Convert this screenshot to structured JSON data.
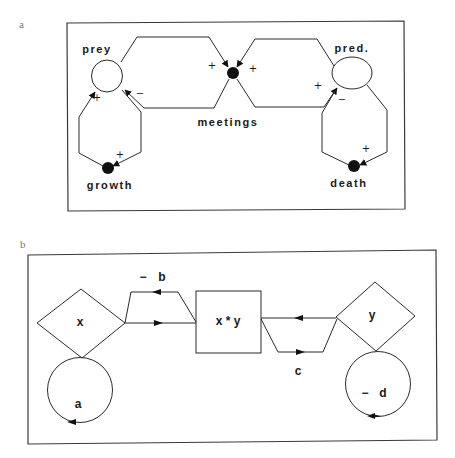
{
  "panel_a": {
    "letter": "a",
    "nodes": {
      "prey": "prey",
      "predator": "pred.",
      "meetings": "meetings",
      "growth": "growth",
      "death": "death"
    },
    "signs": {
      "growth_to_prey": "+",
      "meetings_to_prey": "−",
      "prey_to_growth": "+",
      "prey_to_meetings": "+",
      "pred_to_meetings": "+",
      "meetings_to_pred": "+",
      "death_to_pred": "−",
      "pred_to_death": "+"
    }
  },
  "panel_b": {
    "letter": "b",
    "nodes": {
      "x": "x",
      "product": "x * y",
      "y": "y"
    },
    "flows": {
      "b_sign": "−",
      "b": "b",
      "c": "c"
    },
    "loops": {
      "a": "a",
      "d_sign": "−",
      "d": "d"
    }
  }
}
